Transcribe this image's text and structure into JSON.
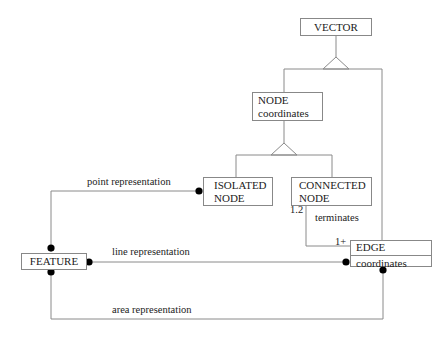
{
  "diagram": {
    "entities": {
      "vector": {
        "name": "VECTOR"
      },
      "node": {
        "name": "NODE",
        "attribute": "coordinates"
      },
      "isolated_node": {
        "line1": "ISOLATED",
        "line2": "NODE"
      },
      "connected_node": {
        "line1": "CONNECTED",
        "line2": "NODE"
      },
      "feature": {
        "name": "FEATURE"
      },
      "edge": {
        "name": "EDGE",
        "attribute": "coordinates"
      }
    },
    "relationships": {
      "point": "point representation",
      "line": "line representation",
      "area": "area representation",
      "terminates": "terminates"
    },
    "cardinalities": {
      "connected_node_side": "1.2",
      "edge_side": "1+"
    },
    "colors": {
      "line": "#888888",
      "box_border": "#888888",
      "dot": "#000000",
      "text": "#222222"
    }
  }
}
